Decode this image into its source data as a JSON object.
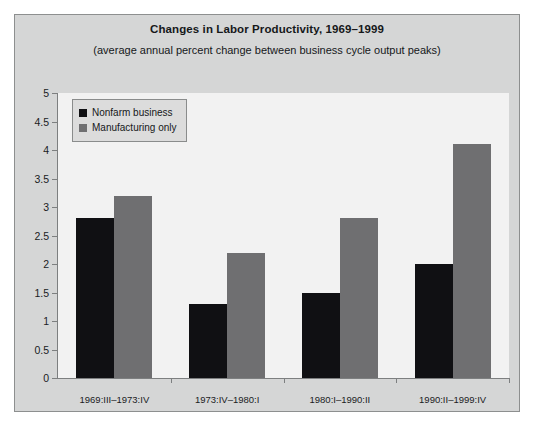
{
  "chart_data": {
    "type": "bar",
    "title": "Changes in Labor Productivity, 1969–1999",
    "subtitle": "(average annual percent change between business cycle output peaks)",
    "xlabel": "",
    "ylabel": "",
    "ylim": [
      0,
      5
    ],
    "ytick_labels": [
      "0",
      "0.5",
      "1",
      "1.5",
      "2",
      "2.5",
      "3",
      "3.5",
      "4",
      "4.5",
      "5"
    ],
    "ytick_values": [
      0,
      0.5,
      1,
      1.5,
      2,
      2.5,
      3,
      3.5,
      4,
      4.5,
      5
    ],
    "grid": false,
    "legend_position": "top-left",
    "categories": [
      "1969:III–1973:IV",
      "1973:IV–1980:I",
      "1980:I–1990:II",
      "1990:II–1999:IV"
    ],
    "series": [
      {
        "name": "Nonfarm business",
        "color": "#101013",
        "values": [
          2.8,
          1.3,
          1.5,
          2.0
        ]
      },
      {
        "name": "Manufacturing only",
        "color": "#6f6f71",
        "values": [
          3.2,
          2.2,
          2.8,
          4.1
        ]
      }
    ]
  },
  "colors": {
    "panel_background": "#d5d6d6",
    "plot_background": "#f2f2f2",
    "axis": "#7d7f80",
    "text": "#16181a",
    "series_nonfarm": "#101013",
    "series_manufacturing": "#6f6f71"
  }
}
